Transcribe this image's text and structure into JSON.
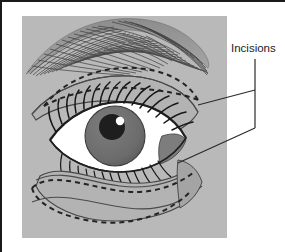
{
  "figure": {
    "name": "eyelid-surgery-incision-diagram",
    "panel": {
      "background_color": "#b9b9b9",
      "x": 20,
      "y": 14,
      "width": 205,
      "height": 222
    },
    "frame": {
      "border_color": "#1a1a1a",
      "background_color": "#ffffff",
      "border_width": 2
    },
    "labels": [
      {
        "id": "incisions",
        "text": "Incisions",
        "x": 229,
        "y": 50,
        "color": "#1c1c1c"
      }
    ],
    "leader_lines": {
      "color": "#2a2a2a",
      "width": 1.2,
      "stem": {
        "x": 253,
        "y_top": 57,
        "y_bottom": 126
      },
      "arms": [
        {
          "id": "upper-incision-pointer",
          "x1": 253,
          "y1": 88,
          "x2": 196,
          "y2": 103
        },
        {
          "id": "lower-incision-pointer",
          "x1": 253,
          "y1": 126,
          "x2": 176,
          "y2": 161
        }
      ]
    },
    "anatomy": {
      "eyebrow": {
        "name": "eyebrow",
        "hair_color": "#4a4a4a",
        "hair_count": 58,
        "fill_color": "#9a9a9a"
      },
      "upper_lid": {
        "name": "upper-eyelid",
        "fill_color": "#b0b0b0",
        "outline_color": "#3a3a3a"
      },
      "lower_lid": {
        "name": "lower-eyelid",
        "fill_color": "#b0b0b0",
        "outline_color": "#3a3a3a"
      },
      "sclera": {
        "name": "sclera",
        "color": "#ffffff"
      },
      "iris": {
        "name": "iris",
        "color": "#6f6f6f",
        "radius": 30
      },
      "pupil": {
        "name": "pupil",
        "color": "#1e1e1e",
        "radius": 13
      },
      "highlight": {
        "name": "corneal-highlight",
        "color": "#ffffff",
        "radius": 4
      },
      "caruncle": {
        "name": "lateral-canthus",
        "color": "#7d7d7d"
      },
      "eyelashes": {
        "name": "eyelashes",
        "color": "#1a1a1a",
        "upper_count": 22,
        "lower_count": 20
      }
    },
    "incision_marks": {
      "style": "dashed",
      "color": "#232323",
      "dash_pattern": "5,4",
      "width": 2,
      "regions": [
        {
          "id": "upper-eyelid-incision",
          "description": "Elliptical dashed marking across the upper eyelid crease"
        },
        {
          "id": "lower-eyelid-incision",
          "description": "Crescent dashed marking below the lower lash line"
        }
      ]
    }
  }
}
